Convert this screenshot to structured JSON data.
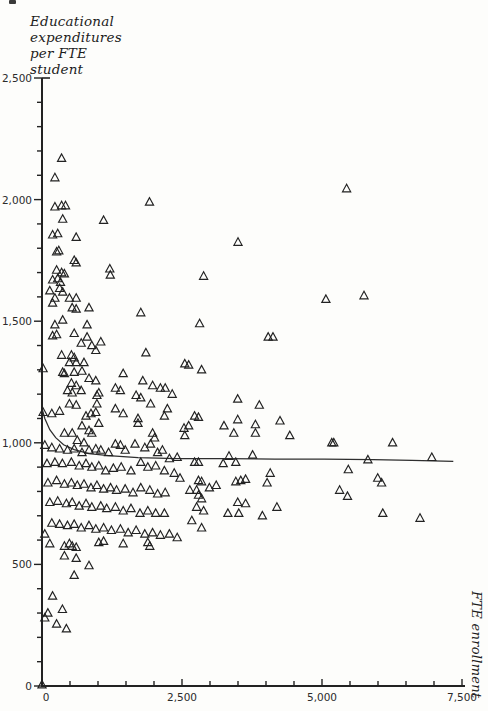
{
  "page": {
    "kind": "scanned textbook scatter diagram"
  },
  "y_axis_title": {
    "lines": [
      "Educational",
      "expenditures",
      "per FTE",
      "student"
    ]
  },
  "x_axis_title": "FTE enrollment",
  "chart_data": {
    "type": "scatter",
    "marker": "open-triangle",
    "title": "",
    "xlabel": "FTE enrollment",
    "ylabel": "Educational expenditures per FTE student",
    "xlim": [
      0,
      7500
    ],
    "ylim": [
      0,
      2500
    ],
    "grid": false,
    "legend": "none",
    "ink_color": "#222222",
    "paper_color": "#fdfdfb",
    "x_major_ticks": [
      0,
      2500,
      5000,
      7500
    ],
    "x_tick_labels": [
      "0",
      "2,500",
      "5,000",
      "7,500"
    ],
    "x_minor_step": 500,
    "y_major_ticks": [
      0,
      500,
      1000,
      1500,
      2000,
      2500
    ],
    "y_tick_labels": [
      "0",
      "500",
      "1,000",
      "1,500",
      "2,000",
      "2,500"
    ],
    "y_minor_step": 100,
    "fit_curve": {
      "description": "nonlinear (hyperbolic) fit of expenditures vs enrollment, declining from ~1140 toward asymptote ~925",
      "points": [
        [
          0,
          1141
        ],
        [
          50,
          1100
        ],
        [
          140,
          1054
        ],
        [
          245,
          1021
        ],
        [
          385,
          992
        ],
        [
          575,
          972
        ],
        [
          840,
          955
        ],
        [
          1190,
          947
        ],
        [
          1715,
          939
        ],
        [
          2415,
          935
        ],
        [
          3285,
          935
        ],
        [
          4160,
          933
        ],
        [
          5035,
          933
        ],
        [
          5910,
          931
        ],
        [
          6610,
          928
        ],
        [
          7345,
          924
        ]
      ]
    },
    "points": [
      [
        350,
        2170
      ],
      [
        230,
        2090
      ],
      [
        230,
        1970
      ],
      [
        350,
        1975
      ],
      [
        420,
        1975
      ],
      [
        1920,
        1990
      ],
      [
        370,
        1920
      ],
      [
        1100,
        1915
      ],
      [
        190,
        1855
      ],
      [
        280,
        1860
      ],
      [
        610,
        1845
      ],
      [
        300,
        1790
      ],
      [
        260,
        1785
      ],
      [
        3500,
        1825
      ],
      [
        5440,
        2045
      ],
      [
        610,
        1740
      ],
      [
        1210,
        1715
      ],
      [
        190,
        1670
      ],
      [
        330,
        1660
      ],
      [
        370,
        1620
      ],
      [
        575,
        1750
      ],
      [
        260,
        1710
      ],
      [
        350,
        1700
      ],
      [
        400,
        1695
      ],
      [
        1220,
        1690
      ],
      [
        280,
        1675
      ],
      [
        315,
        1635
      ],
      [
        140,
        1625
      ],
      [
        230,
        1595
      ],
      [
        490,
        1595
      ],
      [
        610,
        1595
      ],
      [
        2885,
        1685
      ],
      [
        5070,
        1590
      ],
      [
        5750,
        1605
      ],
      [
        190,
        1575
      ],
      [
        540,
        1555
      ],
      [
        610,
        1550
      ],
      [
        840,
        1555
      ],
      [
        1765,
        1535
      ],
      [
        370,
        1505
      ],
      [
        230,
        1485
      ],
      [
        805,
        1485
      ],
      [
        190,
        1440
      ],
      [
        260,
        1445
      ],
      [
        575,
        1450
      ],
      [
        805,
        1435
      ],
      [
        700,
        1410
      ],
      [
        890,
        1400
      ],
      [
        1050,
        1415
      ],
      [
        960,
        1380
      ],
      [
        1855,
        1370
      ],
      [
        350,
        1360
      ],
      [
        525,
        1360
      ],
      [
        575,
        1350
      ],
      [
        2815,
        1490
      ],
      [
        4040,
        1435
      ],
      [
        4125,
        1435
      ],
      [
        490,
        1330
      ],
      [
        610,
        1330
      ],
      [
        750,
        1330
      ],
      [
        20,
        1305
      ],
      [
        370,
        1290
      ],
      [
        400,
        1285
      ],
      [
        575,
        1290
      ],
      [
        715,
        1295
      ],
      [
        2550,
        1325
      ],
      [
        1450,
        1285
      ],
      [
        525,
        1245
      ],
      [
        610,
        1235
      ],
      [
        840,
        1265
      ],
      [
        960,
        1255
      ],
      [
        1800,
        1255
      ],
      [
        1310,
        1225
      ],
      [
        1400,
        1215
      ],
      [
        455,
        1215
      ],
      [
        540,
        1205
      ],
      [
        700,
        1215
      ],
      [
        1015,
        1205
      ],
      [
        980,
        1195
      ],
      [
        1680,
        1195
      ],
      [
        1765,
        1185
      ],
      [
        1975,
        1235
      ],
      [
        2115,
        1225
      ],
      [
        2200,
        1225
      ],
      [
        2325,
        1200
      ],
      [
        2620,
        1320
      ],
      [
        2850,
        1300
      ],
      [
        3495,
        1180
      ],
      [
        20,
        1125
      ],
      [
        175,
        1120
      ],
      [
        315,
        1130
      ],
      [
        490,
        1160
      ],
      [
        610,
        1155
      ],
      [
        785,
        1110
      ],
      [
        875,
        1120
      ],
      [
        960,
        1125
      ],
      [
        980,
        1160
      ],
      [
        1310,
        1140
      ],
      [
        1450,
        1120
      ],
      [
        1715,
        1100
      ],
      [
        1940,
        1160
      ],
      [
        2185,
        1110
      ],
      [
        2240,
        1140
      ],
      [
        400,
        1040
      ],
      [
        540,
        1040
      ],
      [
        715,
        1070
      ],
      [
        840,
        1050
      ],
      [
        890,
        1040
      ],
      [
        630,
        1010
      ],
      [
        750,
        1000
      ],
      [
        1015,
        1080
      ],
      [
        1715,
        1080
      ],
      [
        1975,
        1040
      ],
      [
        2010,
        1020
      ],
      [
        2535,
        1060
      ],
      [
        2550,
        1030
      ],
      [
        3880,
        1155
      ],
      [
        2725,
        1110
      ],
      [
        2795,
        1105
      ],
      [
        3495,
        1095
      ],
      [
        3250,
        1070
      ],
      [
        3810,
        1075
      ],
      [
        4250,
        1090
      ],
      [
        2620,
        1070
      ],
      [
        50,
        990
      ],
      [
        175,
        980
      ],
      [
        315,
        975
      ],
      [
        455,
        970
      ],
      [
        575,
        975
      ],
      [
        715,
        960
      ],
      [
        840,
        970
      ],
      [
        960,
        975
      ],
      [
        1050,
        970
      ],
      [
        1190,
        960
      ],
      [
        1310,
        995
      ],
      [
        1400,
        990
      ],
      [
        1485,
        970
      ],
      [
        1660,
        995
      ],
      [
        1835,
        980
      ],
      [
        1940,
        995
      ],
      [
        2065,
        960
      ],
      [
        2150,
        970
      ],
      [
        2275,
        935
      ],
      [
        2415,
        940
      ],
      [
        3425,
        1040
      ],
      [
        3810,
        1040
      ],
      [
        4425,
        1030
      ],
      [
        5175,
        1000
      ],
      [
        3340,
        945
      ],
      [
        3760,
        950
      ],
      [
        2725,
        920
      ],
      [
        2795,
        920
      ],
      [
        3235,
        915
      ],
      [
        3460,
        920
      ],
      [
        5210,
        1000
      ],
      [
        6260,
        1000
      ],
      [
        5820,
        930
      ],
      [
        6960,
        940
      ],
      [
        90,
        915
      ],
      [
        230,
        920
      ],
      [
        365,
        915
      ],
      [
        525,
        920
      ],
      [
        665,
        905
      ],
      [
        785,
        915
      ],
      [
        890,
        900
      ],
      [
        1015,
        905
      ],
      [
        1135,
        885
      ],
      [
        1275,
        895
      ],
      [
        1415,
        900
      ],
      [
        1590,
        885
      ],
      [
        1765,
        920
      ],
      [
        1890,
        900
      ],
      [
        2030,
        905
      ],
      [
        2185,
        885
      ],
      [
        2360,
        875
      ],
      [
        2465,
        855
      ],
      [
        4075,
        875
      ],
      [
        2795,
        845
      ],
      [
        2850,
        840
      ],
      [
        3460,
        840
      ],
      [
        3550,
        845
      ],
      [
        3635,
        850
      ],
      [
        4020,
        835
      ],
      [
        5470,
        890
      ],
      [
        5995,
        855
      ],
      [
        6065,
        835
      ],
      [
        105,
        835
      ],
      [
        260,
        845
      ],
      [
        400,
        830
      ],
      [
        525,
        835
      ],
      [
        630,
        825
      ],
      [
        750,
        830
      ],
      [
        875,
        815
      ],
      [
        980,
        825
      ],
      [
        1100,
        810
      ],
      [
        1225,
        815
      ],
      [
        1330,
        805
      ],
      [
        1485,
        810
      ],
      [
        1625,
        795
      ],
      [
        1765,
        815
      ],
      [
        1925,
        805
      ],
      [
        2065,
        790
      ],
      [
        2200,
        795
      ],
      [
        2640,
        805
      ],
      [
        2760,
        805
      ],
      [
        2990,
        815
      ],
      [
        3110,
        825
      ],
      [
        5315,
        805
      ],
      [
        5455,
        780
      ],
      [
        140,
        755
      ],
      [
        280,
        760
      ],
      [
        435,
        750
      ],
      [
        540,
        755
      ],
      [
        665,
        740
      ],
      [
        785,
        750
      ],
      [
        890,
        735
      ],
      [
        1050,
        740
      ],
      [
        1155,
        730
      ],
      [
        1310,
        735
      ],
      [
        1450,
        720
      ],
      [
        1590,
        730
      ],
      [
        1750,
        710
      ],
      [
        1890,
        720
      ],
      [
        2030,
        710
      ],
      [
        2185,
        710
      ],
      [
        2795,
        785
      ],
      [
        2850,
        770
      ],
      [
        2760,
        735
      ],
      [
        2885,
        720
      ],
      [
        3495,
        755
      ],
      [
        3635,
        750
      ],
      [
        3320,
        710
      ],
      [
        3515,
        710
      ],
      [
        3935,
        700
      ],
      [
        4195,
        735
      ],
      [
        2675,
        680
      ],
      [
        6085,
        710
      ],
      [
        6750,
        690
      ],
      [
        175,
        670
      ],
      [
        315,
        665
      ],
      [
        455,
        660
      ],
      [
        575,
        665
      ],
      [
        700,
        650
      ],
      [
        840,
        660
      ],
      [
        960,
        645
      ],
      [
        1100,
        650
      ],
      [
        1240,
        640
      ],
      [
        1400,
        645
      ],
      [
        1540,
        630
      ],
      [
        1680,
        640
      ],
      [
        1835,
        625
      ],
      [
        1975,
        630
      ],
      [
        50,
        625
      ],
      [
        2115,
        620
      ],
      [
        2275,
        625
      ],
      [
        2415,
        610
      ],
      [
        2850,
        650
      ],
      [
        140,
        585
      ],
      [
        400,
        575
      ],
      [
        490,
        585
      ],
      [
        540,
        575
      ],
      [
        610,
        570
      ],
      [
        1015,
        590
      ],
      [
        1100,
        595
      ],
      [
        1450,
        585
      ],
      [
        1890,
        590
      ],
      [
        1925,
        575
      ],
      [
        400,
        535
      ],
      [
        610,
        525
      ],
      [
        840,
        495
      ],
      [
        575,
        455
      ],
      [
        190,
        370
      ],
      [
        365,
        315
      ],
      [
        105,
        300
      ],
      [
        50,
        280
      ],
      [
        260,
        255
      ],
      [
        435,
        235
      ],
      [
        0,
        5
      ]
    ]
  }
}
